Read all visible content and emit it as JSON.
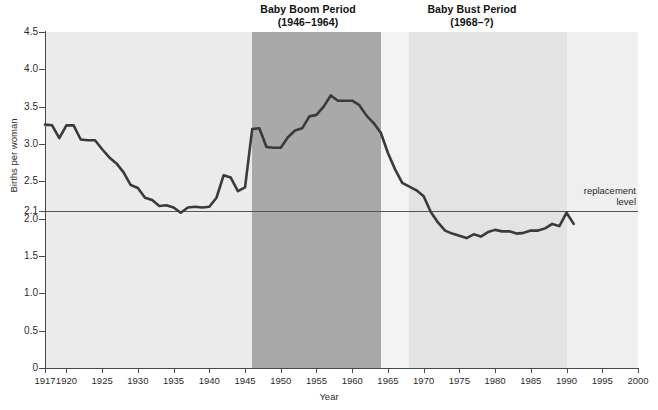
{
  "figure": {
    "axis_title_x": "Year",
    "axis_title_y": "Births per woman",
    "replacement_note_line1": "replacement",
    "replacement_note_line2": "level",
    "boom_title_line1": "Baby Boom Period",
    "boom_title_line2": "(1946–1964)",
    "bust_title_line1": "Baby Bust Period",
    "bust_title_line2": "(1968–?)"
  },
  "colors": {
    "plot_background": "#ebebeb",
    "boom_band": "#a9a9a9",
    "gap_band": "#f3f3f3",
    "bust_band": "#e3e3e3",
    "tail_band": "#efefef",
    "line": "#3a3a3a",
    "replacement_line": "#555555",
    "axis": "#4a4a4a",
    "text": "#1a1a1a"
  },
  "chart_data": {
    "type": "line",
    "title": "",
    "xlabel": "Year",
    "ylabel": "Births per woman",
    "xlim": [
      1917,
      2000
    ],
    "ylim": [
      0,
      4.5
    ],
    "grid": false,
    "legend": null,
    "xticks": [
      1917,
      1920,
      1925,
      1930,
      1935,
      1940,
      1945,
      1950,
      1955,
      1960,
      1965,
      1970,
      1975,
      1980,
      1985,
      1990,
      1995,
      2000
    ],
    "xtick_labels": [
      "1917",
      "1920",
      "1925",
      "1930",
      "1935",
      "1940",
      "1945",
      "1950",
      "1955",
      "1960",
      "1965",
      "1970",
      "1975",
      "1980",
      "1985",
      "1990",
      "1995",
      "2000"
    ],
    "yticks": [
      0,
      0.5,
      1.0,
      1.5,
      2.0,
      2.1,
      2.5,
      3.0,
      3.5,
      4.0,
      4.5
    ],
    "ytick_labels": [
      "0",
      "0.5",
      "1.0",
      "1.5",
      "2.0",
      "2.1",
      "2.5",
      "3.0",
      "3.5",
      "4.0",
      "4.5"
    ],
    "annotations": [
      {
        "name": "replacement-level",
        "type": "hline",
        "y": 2.1,
        "label": "replacement level"
      },
      {
        "name": "baby-boom-band",
        "type": "vspan",
        "x0": 1946,
        "x1": 1964,
        "label": "Baby Boom Period (1946–1964)"
      },
      {
        "name": "baby-bust-band",
        "type": "vspan",
        "x0": 1968,
        "x1": 1990,
        "label": "Baby Bust Period (1968–?)"
      }
    ],
    "series": [
      {
        "name": "Total fertility rate",
        "x": [
          1917,
          1918,
          1919,
          1920,
          1921,
          1922,
          1923,
          1924,
          1925,
          1926,
          1927,
          1928,
          1929,
          1930,
          1931,
          1932,
          1933,
          1934,
          1935,
          1936,
          1937,
          1938,
          1939,
          1940,
          1941,
          1942,
          1943,
          1944,
          1945,
          1946,
          1947,
          1948,
          1949,
          1950,
          1951,
          1952,
          1953,
          1954,
          1955,
          1956,
          1957,
          1958,
          1959,
          1960,
          1961,
          1962,
          1963,
          1964,
          1965,
          1966,
          1967,
          1968,
          1969,
          1970,
          1971,
          1972,
          1973,
          1974,
          1975,
          1976,
          1977,
          1978,
          1979,
          1980,
          1981,
          1982,
          1983,
          1984,
          1985,
          1986,
          1987,
          1988,
          1989,
          1990,
          1991
        ],
        "y": [
          3.26,
          3.25,
          3.08,
          3.25,
          3.25,
          3.06,
          3.05,
          3.05,
          2.93,
          2.82,
          2.74,
          2.62,
          2.45,
          2.41,
          2.28,
          2.25,
          2.17,
          2.18,
          2.15,
          2.08,
          2.15,
          2.16,
          2.15,
          2.16,
          2.28,
          2.58,
          2.55,
          2.37,
          2.42,
          3.2,
          3.21,
          2.96,
          2.95,
          2.95,
          3.09,
          3.18,
          3.21,
          3.37,
          3.39,
          3.5,
          3.65,
          3.58,
          3.58,
          3.58,
          3.52,
          3.38,
          3.28,
          3.15,
          2.88,
          2.66,
          2.48,
          2.43,
          2.38,
          2.3,
          2.09,
          1.95,
          1.84,
          1.8,
          1.77,
          1.74,
          1.79,
          1.76,
          1.82,
          1.85,
          1.83,
          1.83,
          1.8,
          1.81,
          1.84,
          1.84,
          1.87,
          1.93,
          1.9,
          2.08,
          1.93
        ]
      }
    ]
  }
}
